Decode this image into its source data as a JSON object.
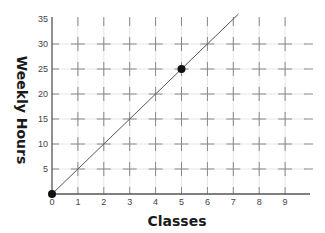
{
  "chart_data": {
    "type": "scatter",
    "title": "",
    "xlabel": "Classes",
    "ylabel": "Weekly Hours",
    "xlim": [
      0,
      10
    ],
    "ylim": [
      0,
      35
    ],
    "x_ticks": [
      0,
      1,
      2,
      3,
      4,
      5,
      6,
      7,
      8,
      9
    ],
    "y_ticks": [
      5,
      10,
      15,
      20,
      25,
      30,
      35
    ],
    "grid": true,
    "grid_style": "crosshair marks at integer x and every 5 on y",
    "legend": null,
    "series": [
      {
        "name": "points",
        "type": "scatter",
        "x": [
          0,
          5
        ],
        "y": [
          0,
          25
        ]
      },
      {
        "name": "trend line",
        "type": "line",
        "x": [
          0,
          7.2
        ],
        "y": [
          0,
          36
        ],
        "equation": "y = 5x"
      }
    ]
  },
  "colors": {
    "axis": "#555555",
    "grid_cross": "#888888",
    "grid_faint": "#e6e6e6",
    "line": "#555555",
    "point": "#111111"
  }
}
